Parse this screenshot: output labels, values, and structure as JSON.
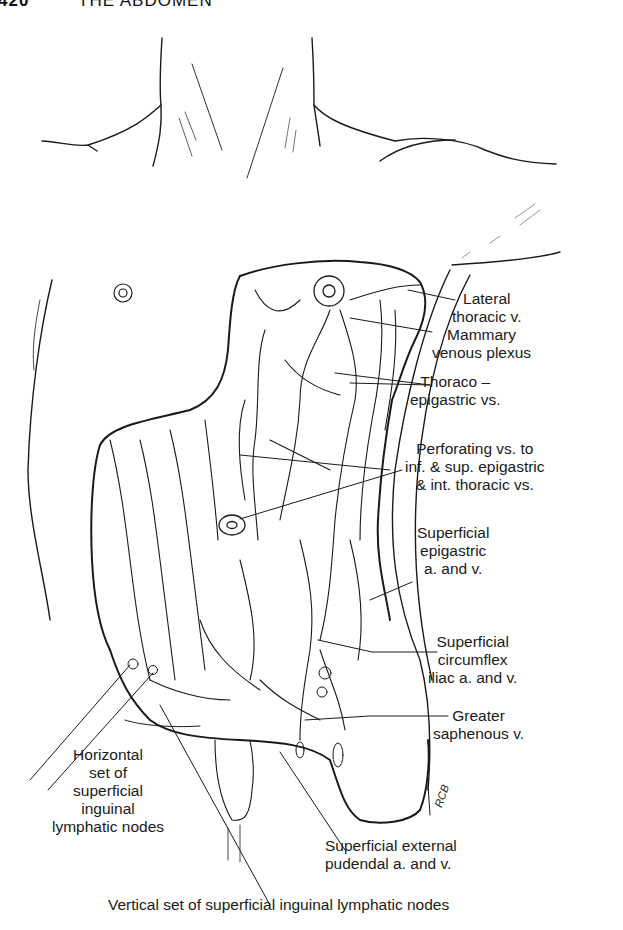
{
  "page": {
    "page_number": "420",
    "running_title": "THE ABDOMEN"
  },
  "figure": {
    "artist_initials": "RCB",
    "labels": {
      "lateral_thoracic": [
        "Lateral",
        "thoracic v."
      ],
      "mammary_plexus": [
        "Mammary",
        "venous plexus"
      ],
      "thoraco_epigastric": [
        "Thoraco –",
        "epigastric vs."
      ],
      "perforating": [
        "Perforating vs. to",
        "inf. & sup. epigastric",
        "& int. thoracic vs."
      ],
      "superficial_epigastric": [
        "Superficial",
        "epigastric",
        "a. and v."
      ],
      "superficial_circumflex": [
        "Superficial",
        "circumflex",
        "iliac a. and v."
      ],
      "greater_saphenous": [
        "Greater",
        "saphenous v."
      ],
      "horizontal_nodes": [
        "Horizontal",
        "set of",
        "superficial",
        "inguinal",
        "lymphatic nodes"
      ],
      "external_pudendal": [
        "Superficial external",
        "pudendal a. and v."
      ],
      "vertical_nodes": "Vertical set of superficial inguinal lymphatic nodes"
    }
  },
  "colors": {
    "ink": "#1a1a1a",
    "paper": "#ffffff"
  }
}
